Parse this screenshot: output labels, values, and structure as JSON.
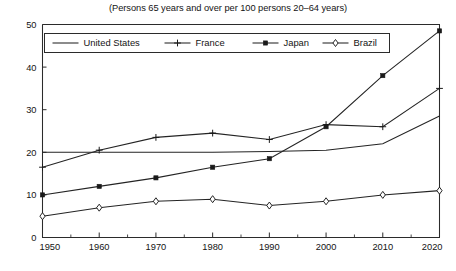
{
  "figure": {
    "clipped_top_text": "",
    "subtitle": "(Persons 65 years and over per 100 persons 20–64 years)"
  },
  "legend": {
    "entries": [
      {
        "label": "United States",
        "marker": "none"
      },
      {
        "label": "France",
        "marker": "plus"
      },
      {
        "label": "Japan",
        "marker": "filled-square"
      },
      {
        "label": "Brazil",
        "marker": "open-diamond"
      }
    ]
  },
  "axes": {
    "x_tick_labels": [
      "1950",
      "1960",
      "1970",
      "1980",
      "1990",
      "2000",
      "2010",
      "2020"
    ],
    "y_tick_labels": [
      "0",
      "10",
      "20",
      "30",
      "40",
      "50"
    ]
  },
  "chart_data": {
    "type": "line",
    "title": "",
    "subtitle": "(Persons 65 years and over per 100 persons 20–64 years)",
    "xlabel": "",
    "ylabel": "",
    "x": [
      1950,
      1960,
      1970,
      1980,
      1990,
      2000,
      2010,
      2020
    ],
    "xlim": [
      1950,
      2020
    ],
    "ylim": [
      0,
      50
    ],
    "xticks": [
      1950,
      1960,
      1970,
      1980,
      1990,
      2000,
      2010,
      2020
    ],
    "yticks": [
      0,
      10,
      20,
      30,
      40,
      50
    ],
    "minor_xticks": [
      1955,
      1965,
      1975,
      1985,
      1995,
      2005,
      2015
    ],
    "grid": false,
    "legend_position": "top-inside",
    "series": [
      {
        "name": "United States",
        "marker": "none",
        "values": [
          20.0,
          20.0,
          20.0,
          20.0,
          20.2,
          20.5,
          22.0,
          28.5
        ]
      },
      {
        "name": "France",
        "marker": "plus",
        "values": [
          16.5,
          20.5,
          23.5,
          24.5,
          23.0,
          26.5,
          26.0,
          35.0
        ]
      },
      {
        "name": "Japan",
        "marker": "filled-square",
        "values": [
          10.0,
          12.0,
          14.0,
          16.5,
          18.5,
          26.0,
          38.0,
          48.5
        ]
      },
      {
        "name": "Brazil",
        "marker": "open-diamond",
        "values": [
          5.0,
          7.0,
          8.5,
          9.0,
          7.5,
          8.5,
          10.0,
          11.0
        ]
      }
    ]
  }
}
